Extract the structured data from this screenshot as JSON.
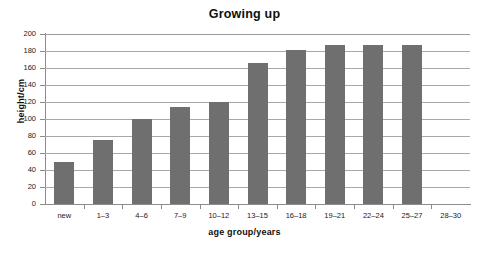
{
  "chart_data": {
    "type": "bar",
    "title": "Growing up",
    "xlabel": "age group/years",
    "ylabel": "height/cm",
    "categories": [
      "new",
      "1–3",
      "4–6",
      "7–9",
      "10–12",
      "13–15",
      "16–18",
      "19–21",
      "22–24",
      "25–27",
      "28–30"
    ],
    "values": [
      50,
      75,
      100,
      114,
      120,
      166,
      181,
      187,
      187,
      187,
      null
    ],
    "ylim": [
      0,
      200
    ],
    "ytick_labels": [
      "200",
      "180",
      "160",
      "140",
      "120",
      "100",
      "80",
      "60",
      "40",
      "20",
      "0"
    ],
    "ytick_values": [
      200,
      180,
      160,
      140,
      120,
      100,
      80,
      60,
      40,
      20,
      0
    ],
    "ytick_step": 20,
    "grid": true,
    "legend": false,
    "bar_color": "#6f6f6f",
    "gridline_color": "#a8a8a8",
    "axis_color": "#8c8c8c",
    "background_color": "#ffffff"
  }
}
